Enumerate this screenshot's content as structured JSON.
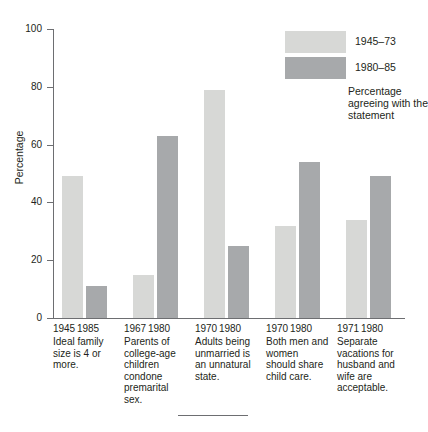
{
  "chart_data": {
    "type": "bar",
    "title": "",
    "xlabel": "",
    "ylabel": "Percentage",
    "ylim": [
      0,
      100
    ],
    "yticks": [
      0,
      20,
      40,
      60,
      80,
      100
    ],
    "grid": false,
    "legend_position": "top-right",
    "legend_caption": "Percentage agreeing with the statement",
    "series": [
      {
        "name": "1945–73",
        "color": "#d7d8d6",
        "values": [
          49,
          15,
          79,
          32,
          34
        ]
      },
      {
        "name": "1980–85",
        "color": "#a7a9ab",
        "values": [
          11,
          63,
          25,
          54,
          49
        ]
      }
    ],
    "groups": [
      {
        "statement": "Ideal family size is 4 or more.",
        "years": [
          "1945",
          "1985"
        ],
        "values": [
          49,
          11
        ]
      },
      {
        "statement": "Parents of college-age children condone premarital sex.",
        "years": [
          "1967",
          "1980"
        ],
        "values": [
          15,
          63
        ]
      },
      {
        "statement": "Adults being unmarried is an unnatural state.",
        "years": [
          "1970",
          "1980"
        ],
        "values": [
          79,
          25
        ]
      },
      {
        "statement": "Both men and women should share child care.",
        "years": [
          "1970",
          "1980"
        ],
        "values": [
          32,
          54
        ]
      },
      {
        "statement": "Separate vacations for husband and wife are acceptable.",
        "years": [
          "1971",
          "1980"
        ],
        "values": [
          34,
          49
        ]
      }
    ]
  }
}
